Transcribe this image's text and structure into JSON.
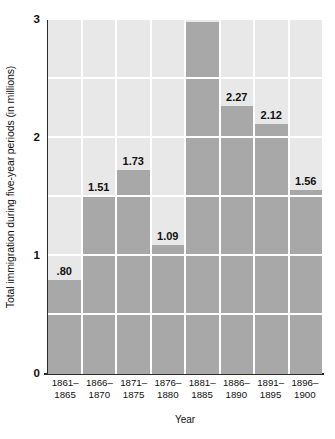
{
  "chart_data": {
    "type": "bar",
    "title": "",
    "xlabel": "Year",
    "ylabel": "Total immigration during five-year periods (in millions)",
    "categories": [
      "1861–\n1865",
      "1866–\n1870",
      "1871–\n1875",
      "1876–\n1880",
      "1881–\n1885",
      "1886–\n1890",
      "1891–\n1895",
      "1896–\n1900"
    ],
    "category_lines": [
      [
        "1861–",
        "1865"
      ],
      [
        "1866–",
        "1870"
      ],
      [
        "1871–",
        "1875"
      ],
      [
        "1876–",
        "1880"
      ],
      [
        "1881–",
        "1885"
      ],
      [
        "1886–",
        "1890"
      ],
      [
        "1891–",
        "1895"
      ],
      [
        "1896–",
        "1900"
      ]
    ],
    "values": [
      0.8,
      1.51,
      1.73,
      1.09,
      2.98,
      2.27,
      2.12,
      1.56
    ],
    "value_labels": [
      ".80",
      "1.51",
      "1.73",
      "1.09",
      "2.98",
      "2.27",
      "2.12",
      "1.56"
    ],
    "ylim": [
      0,
      3
    ],
    "ytick_values": [
      0,
      1,
      2,
      3
    ],
    "ytick_labels": [
      "0",
      "1",
      "2",
      "3"
    ],
    "gridlines": [
      0.5,
      1.0,
      1.5,
      2.0,
      2.5
    ],
    "grid": true,
    "legend": null,
    "colors": {
      "bar_fill": "#a8a8a8",
      "plot_background": "#e8e8e8",
      "gridline": "#ffffff",
      "axis": "#2b2b2b",
      "text": "#111111",
      "page_background": "#ffffff"
    }
  }
}
